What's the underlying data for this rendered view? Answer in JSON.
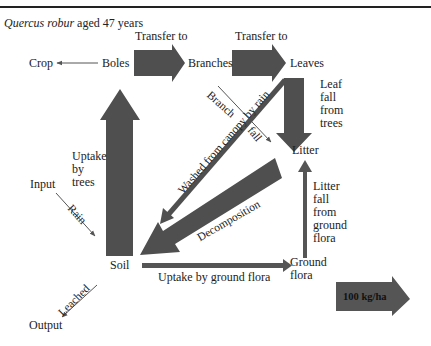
{
  "header": {
    "species": "Quercus robur",
    "age_text": "aged 47 years"
  },
  "nodes": {
    "crop": "Crop",
    "boles": "Boles",
    "branches": "Branches",
    "leaves": "Leaves",
    "litter": "Litter",
    "input": "Input",
    "soil": "Soil",
    "ground_flora": "Ground\nflora",
    "output": "Output"
  },
  "flows": {
    "transfer_boles_branches": "Transfer to",
    "transfer_branches_leaves": "Transfer to",
    "leaf_fall": "Leaf\nfall\nfrom\ntrees",
    "branch_fall_1": "Branch",
    "branch_fall_2": "fall",
    "washed": "Washed from canopy by rain",
    "decomposition": "Decomposition",
    "uptake_trees": "Uptake\nby\ntrees",
    "rain": "Rain",
    "litter_fall_ground": "Litter\nfall\nfrom\nground\nflora",
    "uptake_ground": "Uptake by ground flora",
    "leached": "Leached"
  },
  "legend": {
    "scale_label": "100 kg/ha"
  },
  "colors": {
    "arrow_fill": "#555555",
    "text": "#222222"
  }
}
